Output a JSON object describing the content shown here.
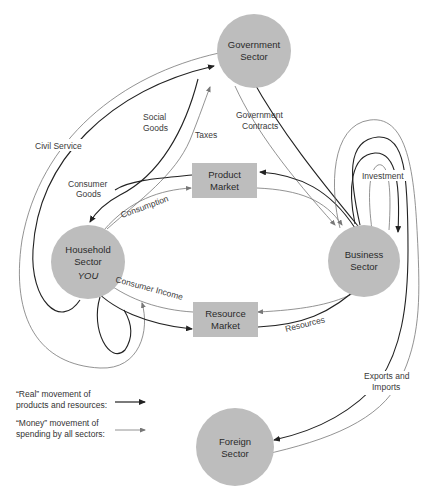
{
  "colors": {
    "node_fill": "#bdbdbd",
    "real_flow": "#222222",
    "money_flow": "#777777",
    "background": "#ffffff"
  },
  "nodes": {
    "government": {
      "line1": "Government",
      "line2": "Sector"
    },
    "household": {
      "line1": "Household",
      "line2": "Sector",
      "line3": "YOU"
    },
    "business": {
      "line1": "Business",
      "line2": "Sector"
    },
    "foreign": {
      "line1": "Foreign",
      "line2": "Sector"
    },
    "product_market": {
      "line1": "Product",
      "line2": "Market"
    },
    "resource_market": {
      "line1": "Resource",
      "line2": "Market"
    }
  },
  "flows": {
    "civil_service": "Civil Service",
    "social_goods_1": "Social",
    "social_goods_2": "Goods",
    "taxes": "Taxes",
    "government_contracts_1": "Government",
    "government_contracts_2": "Contracts",
    "consumer_goods_1": "Consumer",
    "consumer_goods_2": "Goods",
    "consumption": "Consumption",
    "investment": "Investment",
    "consumer_income": "Consumer Income",
    "resources": "Resources",
    "exports_imports_1": "Exports and",
    "exports_imports_2": "Imports"
  },
  "legend": {
    "real_line1": "“Real” movement of",
    "real_line2": "products and resources:",
    "money_line1": "“Money” movement of",
    "money_line2": "spending by all sectors:"
  }
}
